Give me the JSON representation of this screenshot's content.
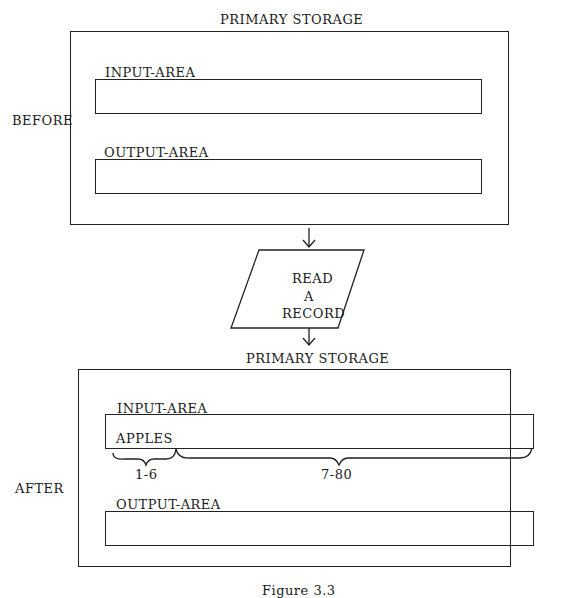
{
  "before": {
    "side_label": "BEFORE",
    "storage_title": "PRIMARY STORAGE",
    "input_area": {
      "label": "INPUT-AREA",
      "content": ""
    },
    "output_area": {
      "label": "OUTPUT-AREA",
      "content": ""
    }
  },
  "process": {
    "shape": "parallelogram",
    "line1": "READ",
    "line2": "A",
    "line3": "RECORD"
  },
  "after": {
    "side_label": "AFTER",
    "storage_title": "PRIMARY STORAGE",
    "input_area": {
      "label": "INPUT-AREA",
      "content": "APPLES",
      "brace_left_label": "1-6",
      "brace_right_label": "7-80"
    },
    "output_area": {
      "label": "OUTPUT-AREA",
      "content": ""
    }
  },
  "caption": "Figure 3.3"
}
